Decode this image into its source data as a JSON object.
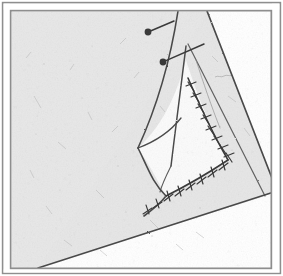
{
  "figure": {
    "title": "Folded paper sheet with curved triangular crease",
    "medium": "halftone engraving / scanned print",
    "caption_text": "",
    "canvas": {
      "width": 283,
      "height": 276
    }
  },
  "colors": {
    "page_background": "#ffffff",
    "paper_gray": "#e7e7e7",
    "paper_gray_dark": "#dedede",
    "paper_white": "#fbfbfb",
    "ink": "#4a4a4a",
    "ink_dark": "#3a3a3a",
    "ink_light": "#8a8a8a",
    "frame_line": "#8e8e8e",
    "texture_speck": "#b9b9b9"
  },
  "frame": {
    "name": "double-rule border",
    "outer": {
      "x": 2,
      "y": 2,
      "width": 279,
      "height": 272,
      "stroke_width": 1.4
    },
    "inner": {
      "x": 10,
      "y": 10,
      "width": 262,
      "height": 259,
      "stroke_width": 1.4
    }
  },
  "regions": [
    {
      "name": "paper-sheet-main",
      "fill": "paper_gray",
      "label": "shaded sheet body"
    },
    {
      "name": "curved-triangle-interior",
      "fill": "paper_white",
      "label": "lifted cusped triangle"
    },
    {
      "name": "lower-right-void",
      "fill": "page_background",
      "label": "white area beyond fold"
    },
    {
      "name": "upper-right-void",
      "fill": "page_background",
      "label": "white area beyond sheet edge"
    }
  ],
  "creases": [
    {
      "name": "fold-diagonal-lower",
      "type": "straight",
      "from": [
        38,
        268
      ],
      "to": [
        277,
        191
      ]
    },
    {
      "name": "sheet-edge-upper-right",
      "type": "straight",
      "from": [
        207,
        11
      ],
      "to": [
        277,
        191
      ]
    },
    {
      "name": "crease-left-cusp-upper",
      "type": "curve",
      "from": [
        178,
        11
      ],
      "to": [
        138,
        148
      ]
    },
    {
      "name": "crease-left-cusp-lower",
      "type": "curve",
      "from": [
        138,
        148
      ],
      "to": [
        166,
        196
      ]
    },
    {
      "name": "crease-spine-vertical",
      "type": "curve",
      "from": [
        188,
        44
      ],
      "to": [
        171,
        165
      ]
    },
    {
      "name": "crease-inner-web",
      "type": "curve",
      "from": [
        138,
        148
      ],
      "to": [
        188,
        120
      ]
    }
  ],
  "hatched_edges": [
    {
      "name": "hatched-edge-right",
      "from": [
        190,
        84
      ],
      "to": [
        228,
        160
      ],
      "tick_count": 8
    },
    {
      "name": "hatched-edge-bottom",
      "from": [
        228,
        160
      ],
      "to": [
        166,
        196
      ],
      "tick_count": 6
    }
  ],
  "pointers": [
    {
      "name": "leader-pointer-upper",
      "dot": {
        "cx": 148,
        "cy": 32,
        "r": 3.4
      },
      "line_to": [
        174,
        21
      ],
      "label": ""
    },
    {
      "name": "leader-pointer-lower",
      "dot": {
        "cx": 163,
        "cy": 62,
        "r": 3.4
      },
      "line_to": [
        204,
        44
      ],
      "label": ""
    }
  ],
  "cusp_points": [
    {
      "name": "cusp-left",
      "x": 138,
      "y": 148
    },
    {
      "name": "cusp-top",
      "x": 188,
      "y": 46
    },
    {
      "name": "cusp-bottom",
      "x": 168,
      "y": 194
    }
  ],
  "vertices": [
    {
      "name": "vertex-right-convergence",
      "x": 277,
      "y": 191
    },
    {
      "name": "vertex-bottom-left-fold",
      "x": 38,
      "y": 268
    }
  ]
}
